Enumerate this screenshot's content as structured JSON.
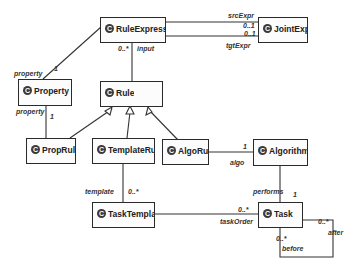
{
  "diagram": {
    "type": "UML class diagram",
    "classes": [
      {
        "id": "RuleExpression",
        "label": "RuleExpression",
        "stereotype_icon": "C"
      },
      {
        "id": "JointExpr",
        "label": "JointExpr",
        "stereotype_icon": "C"
      },
      {
        "id": "Property",
        "label": "Property",
        "stereotype_icon": "C"
      },
      {
        "id": "Rule",
        "label": "Rule",
        "stereotype_icon": "C"
      },
      {
        "id": "PropRule",
        "label": "PropRule",
        "stereotype_icon": "C"
      },
      {
        "id": "TemplateRule",
        "label": "TemplateRule",
        "stereotype_icon": "C"
      },
      {
        "id": "AlgoRule",
        "label": "AlgoRule",
        "stereotype_icon": "C"
      },
      {
        "id": "Algorithm",
        "label": "Algorithm",
        "stereotype_icon": "C"
      },
      {
        "id": "TaskTemplate",
        "label": "TaskTemplate",
        "stereotype_icon": "C"
      },
      {
        "id": "Task",
        "label": "Task",
        "stereotype_icon": "C"
      }
    ],
    "associations": [
      {
        "from": "JointExpr",
        "to": "RuleExpression",
        "role": "srcExpr",
        "multiplicity": "0..1"
      },
      {
        "from": "JointExpr",
        "to": "RuleExpression",
        "role": "tgtExpr",
        "multiplicity": "0..1"
      },
      {
        "from": "RuleExpression",
        "to": "Property",
        "role": "property",
        "multiplicity": "1"
      },
      {
        "from": "Rule",
        "to": "RuleExpression",
        "role": "input",
        "multiplicity": "0..*"
      },
      {
        "from": "PropRule",
        "to": "Property",
        "role": "property",
        "multiplicity": "1"
      },
      {
        "from": "AlgoRule",
        "to": "Algorithm",
        "role": "algo",
        "multiplicity": "1"
      },
      {
        "from": "TemplateRule",
        "to": "TaskTemplate",
        "role": "template",
        "multiplicity": "0..*"
      },
      {
        "from": "Algorithm",
        "to": "Task",
        "role": "performs",
        "multiplicity": "1"
      },
      {
        "from": "TaskTemplate",
        "to": "Task",
        "role": "taskOrder",
        "multiplicity": "0..*"
      },
      {
        "from": "Task",
        "to": "Task",
        "role": "after",
        "multiplicity": "0..*"
      },
      {
        "from": "Task",
        "to": "Task",
        "role": "before",
        "multiplicity": "0..*"
      }
    ],
    "generalizations": [
      {
        "child": "PropRule",
        "parent": "Rule"
      },
      {
        "child": "TemplateRule",
        "parent": "Rule"
      },
      {
        "child": "AlgoRule",
        "parent": "Rule"
      }
    ],
    "labels": {
      "srcExpr": "srcExpr",
      "srcExpr_mult": "0..1",
      "tgtExpr": "tgtExpr",
      "tgtExpr_mult": "0..1",
      "input": "input",
      "input_mult": "0..*",
      "property_top": "property",
      "property_top_mult": "1",
      "property_bottom": "property",
      "property_bottom_mult": "1",
      "algo": "algo",
      "algo_mult": "1",
      "template": "template",
      "template_mult": "0..*",
      "performs": "performs",
      "performs_mult": "1",
      "taskOrder": "taskOrder",
      "taskOrder_mult": "0..*",
      "after": "after",
      "after_mult": "0..*",
      "before": "before",
      "before_mult": "0..*"
    },
    "icon": "C"
  }
}
